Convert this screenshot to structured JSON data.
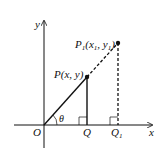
{
  "diagram": {
    "axes": {
      "x_label": "x",
      "y_label": "y",
      "origin_label": "O"
    },
    "points": {
      "P": {
        "label": "P(x, y)",
        "name": "P",
        "coords": "(x, y)"
      },
      "P1": {
        "label": "P1(x1, y1)",
        "name": "P",
        "sub": "1",
        "open": "(x",
        "x_sub": "1",
        "mid": ", y",
        "y_sub": "1",
        "close": ")"
      },
      "Q": {
        "label": "Q"
      },
      "Q1": {
        "label": "Q1",
        "name": "Q",
        "sub": "1"
      }
    },
    "angle_label": "θ",
    "colors": {
      "stroke": "#111111",
      "background": "#ffffff"
    }
  }
}
